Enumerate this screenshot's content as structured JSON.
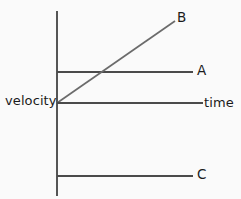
{
  "figure": {
    "background_color": "#fafafa",
    "line_color": "#4a4a4a",
    "axis_color": "#555555",
    "text_color": "#1b1b1b"
  },
  "labels": {
    "velocity": "velocity",
    "time": "time",
    "line_a": "A",
    "line_b": "B",
    "line_c": "C"
  },
  "chart_data": {
    "type": "line",
    "title": "",
    "xlabel": "time",
    "ylabel": "velocity",
    "grid": false,
    "legend": "inline-right-end-labels",
    "xlim": [
      0,
      10
    ],
    "ylim": [
      -4,
      6
    ],
    "axes": {
      "y_axis": {
        "x_px": 57,
        "y_top_px": 11,
        "y_bottom_px": 196
      },
      "x_axis_is_zero_line": true,
      "origin_px": {
        "x": 57,
        "y": 103
      }
    },
    "series": [
      {
        "name": "A",
        "label": "A",
        "style": "horizontal-constant-positive",
        "x": [
          0,
          9.4
        ],
        "y": [
          1.7,
          1.7
        ],
        "pixels": {
          "x1": 57,
          "y1": 72,
          "x2": 193,
          "y2": 72
        }
      },
      {
        "name": "B",
        "label": "B",
        "style": "diagonal-increasing-from-origin",
        "x": [
          0,
          8.1
        ],
        "y": [
          0,
          4.5
        ],
        "pixels": {
          "x1": 57,
          "y1": 103,
          "x2": 175,
          "y2": 21
        }
      },
      {
        "name": "time",
        "label": "time",
        "style": "horizontal-zero-axis",
        "x": [
          0,
          10.1
        ],
        "y": [
          0,
          0
        ],
        "pixels": {
          "x1": 57,
          "y1": 103,
          "x2": 203,
          "y2": 103
        }
      },
      {
        "name": "C",
        "label": "C",
        "style": "horizontal-constant-negative",
        "x": [
          0,
          9.4
        ],
        "y": [
          -4.0,
          -4.0
        ],
        "pixels": {
          "x1": 57,
          "y1": 176,
          "x2": 193,
          "y2": 176
        }
      }
    ]
  }
}
